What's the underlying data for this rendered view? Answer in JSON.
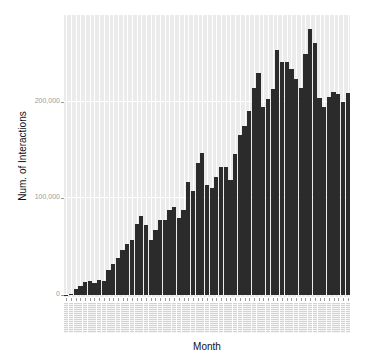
{
  "chart_data": {
    "type": "bar",
    "title": "",
    "xlabel": "Month",
    "ylabel": "Num. of Interactions",
    "ylim": [
      0,
      290000
    ],
    "y_ticks": [
      "0",
      "100,000",
      "200,000"
    ],
    "y_tick_values": [
      0,
      100000,
      200000
    ],
    "grid": true,
    "legend": null,
    "categories_note": "61 monthly categories; x tick labels rendered too small to read",
    "categories": [
      "M1",
      "M2",
      "M3",
      "M4",
      "M5",
      "M6",
      "M7",
      "M8",
      "M9",
      "M10",
      "M11",
      "M12",
      "M13",
      "M14",
      "M15",
      "M16",
      "M17",
      "M18",
      "M19",
      "M20",
      "M21",
      "M22",
      "M23",
      "M24",
      "M25",
      "M26",
      "M27",
      "M28",
      "M29",
      "M30",
      "M31",
      "M32",
      "M33",
      "M34",
      "M35",
      "M36",
      "M37",
      "M38",
      "M39",
      "M40",
      "M41",
      "M42",
      "M43",
      "M44",
      "M45",
      "M46",
      "M47",
      "M48",
      "M49",
      "M50",
      "M51",
      "M52",
      "M53",
      "M54",
      "M55",
      "M56",
      "M57",
      "M58",
      "M59",
      "M60",
      "M61"
    ],
    "values": [
      500,
      1000,
      6000,
      9000,
      13000,
      14000,
      12000,
      16000,
      14000,
      26000,
      32000,
      38000,
      47000,
      53000,
      57000,
      74000,
      82000,
      73000,
      57000,
      67000,
      78000,
      78000,
      88000,
      91000,
      80000,
      88000,
      117000,
      108000,
      137000,
      147000,
      114000,
      111000,
      122000,
      133000,
      133000,
      119000,
      146000,
      166000,
      175000,
      191000,
      214000,
      230000,
      195000,
      203000,
      213000,
      254000,
      241000,
      241000,
      234000,
      224000,
      214000,
      250000,
      276000,
      261000,
      204000,
      195000,
      205000,
      210000,
      208000,
      200000,
      209000
    ],
    "bar_color": "#2b2b2b",
    "panel_background": "#ebebeb"
  },
  "axes": {
    "x_title": "Month",
    "y_title": "Num. of Interactions",
    "y_tick_labels": [
      "0",
      "100,000",
      "200,000"
    ]
  }
}
